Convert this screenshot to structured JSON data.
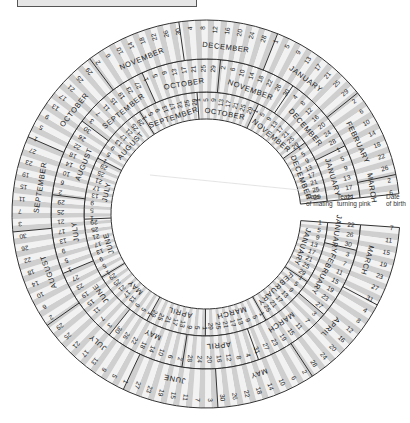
{
  "diagram": {
    "center": [
      206,
      214
    ],
    "start_angle_deg": 4,
    "sweep_deg": 350,
    "colors": {
      "band_light": "#f2f2f2",
      "band_dark": "#cfcfcf",
      "outline": "#333333",
      "text": "#222222",
      "background": "#ffffff"
    },
    "column_headers": [
      {
        "label_line1": "Date",
        "label_line2": "of mating",
        "x": 306,
        "y": 193
      },
      {
        "label_line1": "Teats",
        "label_line2": "turning pink",
        "x": 337,
        "y": 193
      },
      {
        "label_line1": "Date",
        "label_line2": "of birth",
        "x": 386,
        "y": 193
      }
    ],
    "rings": [
      {
        "name": "date-of-mating",
        "r_inner": 95,
        "r_outer": 122,
        "start_month": 0,
        "start_day": 1,
        "months": [
          "JANUARY",
          "FEBRUARY",
          "MARCH",
          "APRIL",
          "MAY",
          "JUNE",
          "JULY",
          "AUGUST",
          "SEPTEMBER",
          "OCTOBER",
          "NOVEMBER",
          "DECEMBER"
        ],
        "first_days": [
          1,
          2,
          3,
          4,
          5,
          6,
          7,
          8,
          9,
          10,
          11,
          12
        ]
      },
      {
        "name": "teats-turning-pink",
        "r_inner": 122,
        "r_outer": 155,
        "start_month": 0,
        "start_day": 22,
        "months": [
          "JANUARY",
          "FEBRUARY",
          "MARCH",
          "APRIL",
          "MAY",
          "JUNE",
          "JULY",
          "AUGUST",
          "SEPTEMBER",
          "OCTOBER",
          "NOVEMBER",
          "DECEMBER"
        ]
      },
      {
        "name": "date-of-birth",
        "r_inner": 155,
        "r_outer": 194,
        "start_month": 2,
        "start_day": 7,
        "months": [
          "JANUARY",
          "FEBRUARY",
          "MARCH",
          "APRIL",
          "MAY",
          "JUNE",
          "JULY",
          "AUGUST",
          "SEPTEMBER",
          "OCTOBER",
          "NOVEMBER",
          "DECEMBER"
        ]
      }
    ],
    "month_lengths": [
      31,
      28,
      31,
      30,
      31,
      30,
      31,
      31,
      30,
      31,
      30,
      31
    ],
    "day_step": 4,
    "visible_samples": {
      "mating_january": [
        1,
        5,
        9,
        13,
        17,
        21,
        25,
        29
      ],
      "teats_january": [
        22,
        26,
        30
      ],
      "birth_march": [
        7,
        11,
        15,
        19,
        23,
        27,
        31
      ],
      "birth_april": [
        4,
        8,
        12,
        16,
        20,
        24,
        28
      ],
      "birth_end_march": [
        2,
        6
      ],
      "birth_december": [
        4,
        8,
        12,
        16,
        20,
        24,
        28
      ],
      "teats_december": [
        4,
        8,
        12,
        16,
        20,
        24,
        28
      ]
    }
  }
}
